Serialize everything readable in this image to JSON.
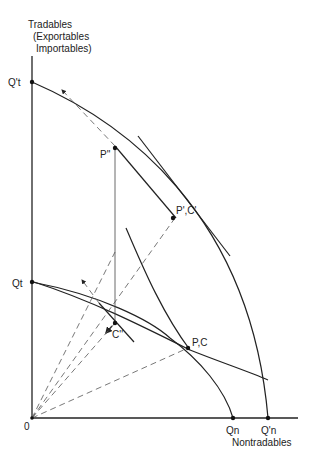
{
  "figure": {
    "y_axis_label": [
      "Tradables",
      "(Exportables",
      "Importables)"
    ],
    "x_axis_label": "Nontradables",
    "origin_label": "0",
    "points": {
      "Qt_prime": "Q't",
      "Qt": "Qt",
      "Qn": "Qn",
      "Qn_prime": "Q'n",
      "P_double_prime": "P''",
      "P_prime_C_prime": "P',C'",
      "P_C": "P,C",
      "C_double_prime": "C''"
    },
    "caption_visible": "Figure ..."
  }
}
